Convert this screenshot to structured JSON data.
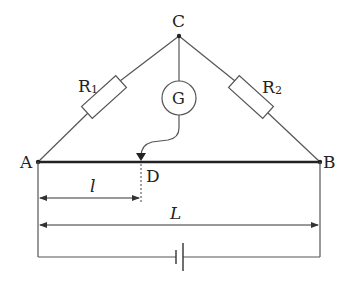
{
  "diagram": {
    "type": "wheatstone-bridge-slide-wire",
    "nodes": {
      "A": {
        "label": "A",
        "x": 38,
        "y": 162
      },
      "B": {
        "label": "B",
        "x": 320,
        "y": 162
      },
      "C": {
        "label": "C",
        "x": 179,
        "y": 36
      },
      "D": {
        "label": "D",
        "x": 140,
        "y": 162
      }
    },
    "components": {
      "R1": {
        "label": "R",
        "sub": "1"
      },
      "R2": {
        "label": "R",
        "sub": "2"
      },
      "galvanometer": {
        "label": "G"
      },
      "battery": {
        "label": ""
      }
    },
    "dimensions": {
      "short_length": {
        "label": "l"
      },
      "full_length": {
        "label": "L"
      }
    },
    "colors": {
      "wire": "#555555",
      "slide_wire": "#222222",
      "text": "#222222"
    }
  }
}
